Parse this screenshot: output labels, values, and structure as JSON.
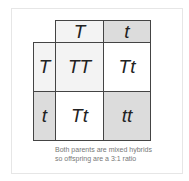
{
  "punnett": {
    "top_headers": [
      "T",
      "t"
    ],
    "left_headers": [
      "T",
      "t"
    ],
    "cells": [
      [
        "TT",
        "Tt"
      ],
      [
        "Tt",
        "tt"
      ]
    ]
  },
  "caption": {
    "line1": "Both parents are mixed hybrids",
    "line2": "so offspring are a 3:1 ratio"
  },
  "colors": {
    "shaded": "#dcdcdc",
    "border": "#444444"
  }
}
